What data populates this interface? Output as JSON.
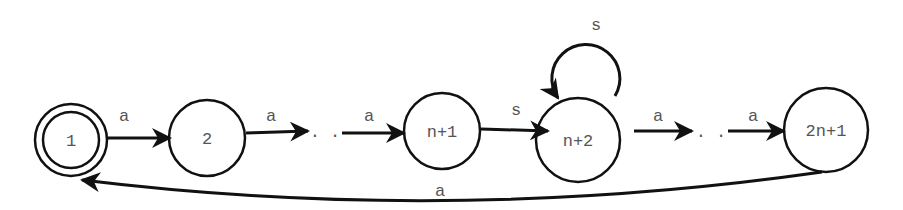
{
  "diagram": {
    "type": "finite-automaton",
    "stroke_color": "#111111",
    "text_color": "#555555",
    "background": "#ffffff",
    "states": [
      {
        "id": "s1",
        "label": "1",
        "cx": 71,
        "cy": 140,
        "r": 36,
        "accepting": true,
        "inner_r": 28
      },
      {
        "id": "s2",
        "label": "2",
        "cx": 207,
        "cy": 138,
        "r": 38
      },
      {
        "id": "sn1",
        "label": "n+1",
        "cx": 442,
        "cy": 131,
        "r": 38
      },
      {
        "id": "sn2",
        "label": "n+2",
        "cx": 578,
        "cy": 140,
        "r": 42
      },
      {
        "id": "s2n1",
        "label": "2n+1",
        "cx": 826,
        "cy": 130,
        "r": 42
      }
    ],
    "edges": [
      {
        "id": "e1",
        "from": "s1",
        "to": "s2",
        "label": "a",
        "x1": 107,
        "y1": 138,
        "x2": 170,
        "y2": 138,
        "lx": 124,
        "ly": 121
      },
      {
        "id": "e2",
        "from": "s2",
        "to": "dots1",
        "label": "a",
        "x1": 246,
        "y1": 133,
        "x2": 308,
        "y2": 131,
        "lx": 271,
        "ly": 121
      },
      {
        "id": "e3",
        "from": "dots1",
        "to": "sn1",
        "label": "a",
        "x1": 342,
        "y1": 133,
        "x2": 404,
        "y2": 133,
        "lx": 369,
        "ly": 121
      },
      {
        "id": "e4",
        "from": "sn1",
        "to": "sn2",
        "label": "s",
        "x1": 481,
        "y1": 129,
        "x2": 548,
        "y2": 131,
        "lx": 516,
        "ly": 115
      },
      {
        "id": "e5",
        "from": "sn2",
        "to": "dots2",
        "label": "a",
        "x1": 634,
        "y1": 131,
        "x2": 692,
        "y2": 131,
        "lx": 658,
        "ly": 121
      },
      {
        "id": "e6",
        "from": "dots2",
        "to": "s2n1",
        "label": "a",
        "x1": 728,
        "y1": 131,
        "x2": 784,
        "y2": 131,
        "lx": 753,
        "ly": 121
      }
    ],
    "ellipses": [
      {
        "id": "dots1",
        "text": ". .",
        "x": 325,
        "y": 137
      },
      {
        "id": "dots2",
        "text": ". .",
        "x": 711,
        "y": 137
      }
    ],
    "self_loop": {
      "state": "sn2",
      "label": "s",
      "cx": 590,
      "cy": 70,
      "r": 35,
      "lx": 596,
      "ly": 30
    },
    "back_edge": {
      "from": "s2n1",
      "to": "s1",
      "label": "a",
      "lx": 440,
      "ly": 196
    }
  }
}
